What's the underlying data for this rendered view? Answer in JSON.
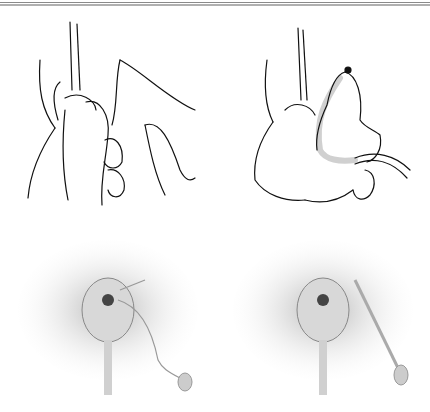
{
  "figure": {
    "panels": [
      {
        "id": "top-left",
        "type": "line-drawing",
        "subject": "hands holding an instrument"
      },
      {
        "id": "top-right",
        "type": "line-drawing",
        "subject": "hand with a curved instrument and tube"
      },
      {
        "id": "bottom-left",
        "type": "shaded-illustration",
        "subject": "anatomical view with a thread-like device"
      },
      {
        "id": "bottom-right",
        "type": "shaded-illustration",
        "subject": "anatomical view with a straight device"
      }
    ],
    "colors": {
      "line": "#111111",
      "shade": "#9a9a9a",
      "highlight": "#d0d0d0",
      "rule": "#8a8a8a"
    }
  }
}
